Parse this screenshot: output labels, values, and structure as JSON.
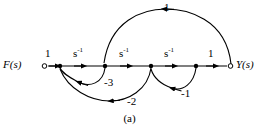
{
  "figure": {
    "type": "signal-flow-graph",
    "caption": "(a)",
    "input_label": "F(s)",
    "output_label": "Y(s)",
    "stroke_color": "#000000",
    "background_color": "#ffffff"
  },
  "nodes": [
    {
      "id": "n0",
      "name": "input-node",
      "x": 43,
      "y": 66,
      "style": "open",
      "label": "F(s)"
    },
    {
      "id": "n1",
      "name": "node-1",
      "x": 60,
      "y": 66,
      "style": "filled",
      "label": ""
    },
    {
      "id": "n2",
      "name": "node-2",
      "x": 105,
      "y": 66,
      "style": "filled",
      "label": ""
    },
    {
      "id": "n3",
      "name": "node-3",
      "x": 151,
      "y": 66,
      "style": "filled",
      "label": ""
    },
    {
      "id": "n4",
      "name": "node-4",
      "x": 196,
      "y": 66,
      "style": "filled",
      "label": ""
    },
    {
      "id": "n5",
      "name": "output-node",
      "x": 232,
      "y": 66,
      "style": "open",
      "label": "Y(s)"
    }
  ],
  "branches": [
    {
      "id": "b1",
      "name": "branch-input-gain",
      "from": "n0",
      "to": "n1",
      "gain": "1",
      "gain_exp": "",
      "path": "straight",
      "direction": "right",
      "label_x": 47,
      "label_y": 50
    },
    {
      "id": "b2",
      "name": "branch-integrator-1",
      "from": "n1",
      "to": "n2",
      "gain": "s",
      "gain_exp": "-1",
      "path": "straight",
      "direction": "right",
      "label_x": 76,
      "label_y": 50
    },
    {
      "id": "b3",
      "name": "branch-integrator-2",
      "from": "n2",
      "to": "n3",
      "gain": "s",
      "gain_exp": "-1",
      "path": "straight",
      "direction": "right",
      "label_x": 121,
      "label_y": 50
    },
    {
      "id": "b4",
      "name": "branch-integrator-3",
      "from": "n3",
      "to": "n4",
      "gain": "s",
      "gain_exp": "-1",
      "path": "straight",
      "direction": "right",
      "label_x": 166,
      "label_y": 50
    },
    {
      "id": "b5",
      "name": "branch-output-gain",
      "from": "n4",
      "to": "n5",
      "gain": "1",
      "gain_exp": "",
      "path": "straight",
      "direction": "right",
      "label_x": 209,
      "label_y": 50
    },
    {
      "id": "b6",
      "name": "feedforward-branch-top",
      "from": "n5",
      "to": "n2",
      "gain": "1",
      "gain_exp": "",
      "path": "arc-top",
      "direction": "left",
      "label_x": 166,
      "label_y": 6
    },
    {
      "id": "b7",
      "name": "feedback-branch-minus3",
      "from": "n2",
      "to": "n1",
      "gain": "-3",
      "gain_exp": "",
      "path": "arc-bottom",
      "direction": "left",
      "label_x": 106,
      "label_y": 80
    },
    {
      "id": "b8",
      "name": "feedback-branch-minus2",
      "from": "n3",
      "to": "n1",
      "gain": "-2",
      "gain_exp": "",
      "path": "arc-bottom",
      "direction": "left",
      "label_x": 129,
      "label_y": 99
    },
    {
      "id": "b9",
      "name": "feedback-branch-minus1",
      "from": "n4",
      "to": "n3",
      "gain": "-1",
      "gain_exp": "",
      "path": "arc-bottom",
      "direction": "left",
      "label_x": 183,
      "label_y": 91
    }
  ]
}
